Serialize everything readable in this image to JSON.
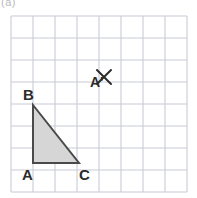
{
  "figure": {
    "caption": "(a)",
    "background_color": "#ffffff"
  },
  "grid": {
    "columns": 8,
    "rows": 8,
    "cell_size": 22,
    "origin_x": 11,
    "origin_y": 16,
    "line_color": "#c9ccd6",
    "line_width": 1.1
  },
  "triangle": {
    "name": "triangle-ABC",
    "fill_color": "#d6d6d6",
    "stroke_color": "#4a4a4a",
    "stroke_width": 2,
    "points": "33,105 33,163 79,163",
    "vertices": [
      {
        "label": "B",
        "x": 33,
        "y": 105,
        "label_x": 23,
        "label_y": 100
      },
      {
        "label": "A",
        "x": 33,
        "y": 163,
        "label_x": 22,
        "label_y": 180
      },
      {
        "label": "C",
        "x": 79,
        "y": 163,
        "label_x": 79,
        "label_y": 180
      }
    ]
  },
  "image_point": {
    "label": "A'",
    "label_x": 90,
    "label_y": 87,
    "mark_center_x": 104,
    "mark_center_y": 77,
    "mark_arm": 7,
    "mark_color": "#2b2b2b",
    "mark_width": 2,
    "icon": "x-mark-icon"
  },
  "labels": {
    "B": "B",
    "A": "A",
    "C": "C",
    "A_prime": "A'"
  }
}
